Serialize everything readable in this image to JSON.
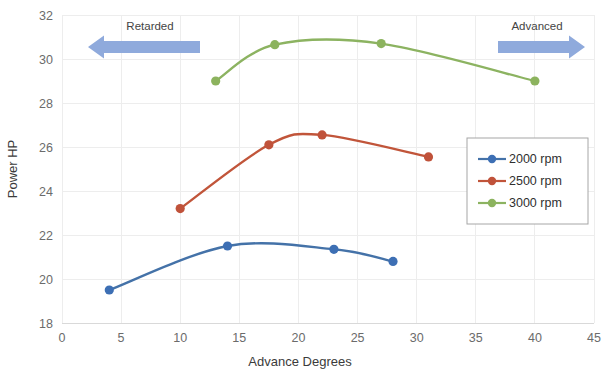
{
  "chart_data": {
    "type": "line",
    "title": "",
    "xlabel": "Advance Degrees",
    "ylabel": "Power HP",
    "xlim": [
      0,
      45
    ],
    "ylim": [
      18,
      32
    ],
    "xticks": [
      0,
      5,
      10,
      15,
      20,
      25,
      30,
      35,
      40,
      45
    ],
    "yticks": [
      18,
      20,
      22,
      24,
      26,
      28,
      30,
      32
    ],
    "grid": true,
    "legend_position": "right",
    "series": [
      {
        "name": "2000 rpm",
        "color": "#4472a8",
        "marker_color": "#3d6fb4",
        "x": [
          4,
          14,
          23,
          28
        ],
        "y": [
          19.5,
          21.5,
          21.35,
          20.8
        ]
      },
      {
        "name": "2500 rpm",
        "color": "#c1553a",
        "marker_color": "#c0523a",
        "x": [
          10,
          17.5,
          22,
          31
        ],
        "y": [
          23.2,
          26.1,
          26.55,
          25.55
        ]
      },
      {
        "name": "3000 rpm",
        "color": "#8cb361",
        "marker_color": "#8cb35e",
        "x": [
          13,
          18,
          27,
          40
        ],
        "y": [
          29.0,
          30.65,
          30.7,
          29.0
        ]
      }
    ],
    "annotations": [
      {
        "id": "retarded",
        "text": "Retarded",
        "arrow_direction": "left",
        "arrow_color": "#8faadc"
      },
      {
        "id": "advanced",
        "text": "Advanced",
        "arrow_direction": "right",
        "arrow_color": "#8faadc"
      }
    ]
  },
  "axes": {
    "x_tick_labels": [
      "0",
      "5",
      "10",
      "15",
      "20",
      "25",
      "30",
      "35",
      "40",
      "45"
    ],
    "y_tick_labels": [
      "18",
      "20",
      "22",
      "24",
      "26",
      "28",
      "30",
      "32"
    ],
    "x_axis_title": "Advance Degrees",
    "y_axis_title": "Power HP"
  },
  "legend": {
    "items": [
      {
        "label": "2000 rpm"
      },
      {
        "label": "2500 rpm"
      },
      {
        "label": "3000 rpm"
      }
    ]
  },
  "annotations": {
    "retarded_label": "Retarded",
    "advanced_label": "Advanced"
  }
}
